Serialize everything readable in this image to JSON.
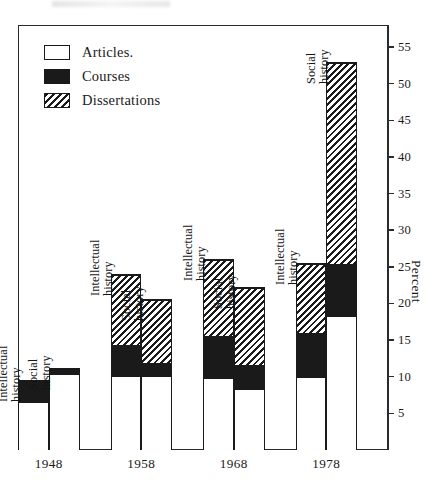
{
  "figure": {
    "axis_title": "Percent",
    "legend": [
      {
        "key": "articles",
        "label": "Articles.",
        "pattern": "open"
      },
      {
        "key": "courses",
        "label": "Courses",
        "pattern": "solid"
      },
      {
        "key": "dissertations",
        "label": "Dissertations",
        "pattern": "hatch"
      }
    ]
  },
  "chart_data": {
    "type": "bar",
    "title": "",
    "subtitle": "",
    "xlabel": "",
    "ylabel": "Percent",
    "ylim": [
      0,
      58
    ],
    "yticks": [
      5,
      10,
      15,
      20,
      25,
      30,
      35,
      40,
      45,
      50,
      55
    ],
    "ytick_labels": [
      "5",
      "10",
      "15",
      "20",
      "25",
      "30",
      "35",
      "40",
      "45",
      "50",
      "55"
    ],
    "grid": false,
    "stacked": true,
    "legend_position": "top-left",
    "categories": [
      "1948",
      "1958",
      "1968",
      "1978"
    ],
    "subcategories": [
      "Intellectual history",
      "Social history"
    ],
    "series": [
      {
        "name": "Articles",
        "pattern": "open"
      },
      {
        "name": "Courses",
        "pattern": "solid"
      },
      {
        "name": "Dissertations",
        "pattern": "hatch"
      }
    ],
    "groups": [
      {
        "year": "1948",
        "bars": [
          {
            "label": "Intellectual history",
            "label_lines": [
              "Intellectual",
              "history"
            ],
            "segments": {
              "articles": 6.5,
              "courses": 3.0,
              "dissertations": 0
            },
            "total": 9.5
          },
          {
            "label": "Social history",
            "label_lines": [
              "Social",
              "history"
            ],
            "segments": {
              "articles": 10.4,
              "courses": 0.8,
              "dissertations": 0
            },
            "total": 11.2
          }
        ]
      },
      {
        "year": "1958",
        "bars": [
          {
            "label": "Intellectual history",
            "label_lines": [
              "Intellectual",
              "history"
            ],
            "segments": {
              "articles": 10.0,
              "courses": 4.4,
              "dissertations": 9.6
            },
            "total": 24.0
          },
          {
            "label": "Social history",
            "label_lines": [
              "Social",
              "history"
            ],
            "segments": {
              "articles": 10.0,
              "courses": 2.0,
              "dissertations": 8.6
            },
            "total": 20.6
          }
        ]
      },
      {
        "year": "1968",
        "bars": [
          {
            "label": "Intellectual history",
            "label_lines": [
              "Intellectual",
              "history"
            ],
            "segments": {
              "articles": 9.8,
              "courses": 5.8,
              "dissertations": 10.4
            },
            "total": 26.0
          },
          {
            "label": "Social history",
            "label_lines": [
              "Social",
              "history"
            ],
            "segments": {
              "articles": 8.3,
              "courses": 3.4,
              "dissertations": 10.6
            },
            "total": 22.3
          }
        ]
      },
      {
        "year": "1978",
        "bars": [
          {
            "label": "Intellectual history",
            "label_lines": [
              "Intellectual",
              "history"
            ],
            "segments": {
              "articles": 9.9,
              "courses": 6.1,
              "dissertations": 9.5
            },
            "total": 25.5
          },
          {
            "label": "Social history",
            "label_lines": [
              "Social",
              "history"
            ],
            "segments": {
              "articles": 18.2,
              "courses": 7.3,
              "dissertations": 27.5
            },
            "total": 53.0
          }
        ]
      }
    ]
  }
}
